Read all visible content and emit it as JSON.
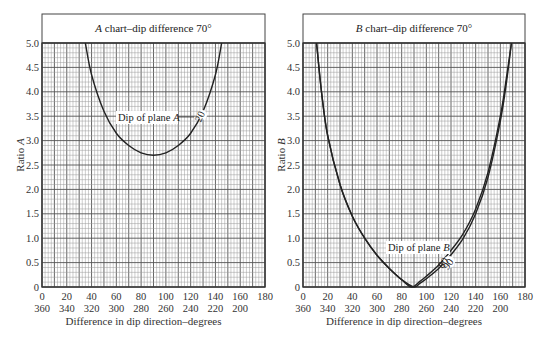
{
  "chart_data": [
    {
      "type": "line",
      "title_italic": "A",
      "title": " chart–dip difference 70°",
      "xlabel": "Difference in dip direction–degrees",
      "ylabel": "Ratio A",
      "ylabel_prefix": "Ratio ",
      "ylabel_italic": "A",
      "xlim": [
        0,
        180
      ],
      "ylim": [
        0,
        5.0
      ],
      "grid": true,
      "x_ticks_top": [
        "0",
        "20",
        "40",
        "60",
        "80",
        "100",
        "120",
        "140",
        "160",
        "180"
      ],
      "x_ticks_bottom": [
        "360",
        "340",
        "320",
        "300",
        "280",
        "260",
        "240",
        "220",
        "200"
      ],
      "y_ticks": [
        "0",
        "0.5",
        "1.0",
        "1.5",
        "2.0",
        "2.5",
        "3.0",
        "3.5",
        "4.0",
        "4.5",
        "5.0"
      ],
      "annotation": {
        "text": "Dip of plane ",
        "italic": "A",
        "curve_label": "20"
      },
      "series": [
        {
          "name": "Dip of plane A = 20°",
          "x": [
            35,
            40,
            50,
            60,
            70,
            80,
            90,
            100,
            110,
            120,
            130,
            140,
            145
          ],
          "y": [
            5.0,
            4.35,
            3.6,
            3.15,
            2.9,
            2.75,
            2.7,
            2.75,
            2.9,
            3.15,
            3.6,
            4.35,
            5.0
          ]
        }
      ]
    },
    {
      "type": "line",
      "title_italic": "B",
      "title": " chart–dip difference 70°",
      "xlabel": "Difference in dip direction–degrees",
      "ylabel": "Ratio B",
      "ylabel_prefix": "Ratio ",
      "ylabel_italic": "B",
      "xlim": [
        0,
        180
      ],
      "ylim": [
        0,
        5.0
      ],
      "grid": true,
      "x_ticks_top": [
        "0",
        "20",
        "40",
        "60",
        "80",
        "100",
        "120",
        "140",
        "160",
        "180"
      ],
      "x_ticks_bottom": [
        "360",
        "340",
        "320",
        "300",
        "280",
        "260",
        "240",
        "220",
        "200"
      ],
      "y_ticks": [
        "0",
        "0.5",
        "1.0",
        "1.5",
        "2.0",
        "2.5",
        "3.0",
        "3.5",
        "4.0",
        "4.5",
        "5.0"
      ],
      "annotation": {
        "text": "Dip of plane ",
        "italic": "B",
        "curve_labels": [
          "80",
          "90"
        ]
      },
      "series": [
        {
          "name": "Dip of plane B = 80°",
          "x": [
            11,
            15,
            20,
            30,
            40,
            50,
            60,
            70,
            80,
            88,
            95,
            100,
            110,
            120,
            130,
            140,
            150,
            160,
            165,
            169
          ],
          "y": [
            5.0,
            4.0,
            3.1,
            2.1,
            1.45,
            1.0,
            0.65,
            0.38,
            0.15,
            0.0,
            0.12,
            0.22,
            0.45,
            0.75,
            1.1,
            1.6,
            2.35,
            3.5,
            4.3,
            5.0
          ]
        },
        {
          "name": "Dip of plane B = 90°",
          "x": [
            11,
            15,
            20,
            30,
            40,
            50,
            60,
            70,
            80,
            90,
            95,
            100,
            110,
            120,
            130,
            140,
            150,
            160,
            165,
            169
          ],
          "y": [
            5.0,
            4.0,
            3.1,
            2.1,
            1.45,
            1.0,
            0.65,
            0.38,
            0.15,
            0.0,
            0.08,
            0.17,
            0.38,
            0.66,
            1.0,
            1.5,
            2.25,
            3.4,
            4.2,
            5.0
          ]
        }
      ]
    }
  ]
}
